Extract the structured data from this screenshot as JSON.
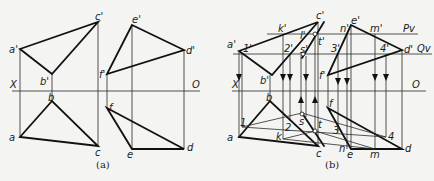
{
  "figure_a": {
    "caption": "(a)",
    "axis": {
      "left_label": "X",
      "right_label": "O"
    },
    "points_front": {
      "a": "a'",
      "b": "b'",
      "c": "c'",
      "d": "d'",
      "e": "e'",
      "f": "f'"
    },
    "points_top": {
      "a": "a",
      "b": "b",
      "c": "c",
      "d": "d",
      "e": "e",
      "f": "f"
    }
  },
  "figure_b": {
    "caption": "(b)",
    "axis": {
      "left_label": "X",
      "right_label": "O"
    },
    "plane_labels": {
      "p": "Pv",
      "q": "Qv"
    },
    "points_front": {
      "a": "a'",
      "b": "b'",
      "c": "c'",
      "d": "d'",
      "e": "e'",
      "f": "f'",
      "k": "k'",
      "l": "l'",
      "t": "t'",
      "s": "s'",
      "n": "n'",
      "m": "m'",
      "p1": "1'",
      "p2": "2'",
      "p3": "3'",
      "p4": "4'"
    },
    "points_top": {
      "a": "a",
      "b": "b",
      "c": "c",
      "d": "d",
      "e": "e",
      "f": "f",
      "k": "k",
      "s": "s",
      "t": "t",
      "n": "n",
      "m": "m",
      "p1": "1",
      "p2": "2",
      "p3": "3",
      "p4": "4"
    }
  }
}
